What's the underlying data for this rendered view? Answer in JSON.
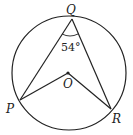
{
  "diagram": {
    "type": "circle-geometry",
    "points": {
      "Q": {
        "label": "Q",
        "x": 72,
        "y": 19
      },
      "O": {
        "label": "O",
        "x": 68,
        "y": 73
      },
      "P": {
        "label": "P",
        "x": 20,
        "y": 100
      },
      "R": {
        "label": "R",
        "x": 111,
        "y": 109
      }
    },
    "circle": {
      "cx": 69,
      "cy": 73,
      "r": 57
    },
    "angle_label": "54°",
    "colors": {
      "stroke": "#222222",
      "background": "#ffffff"
    }
  }
}
